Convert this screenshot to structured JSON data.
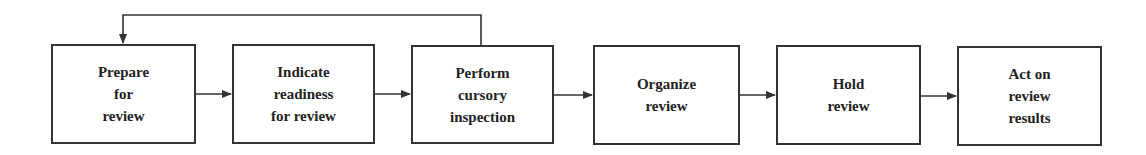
{
  "diagram": {
    "type": "flowchart",
    "steps": [
      {
        "id": "s1",
        "label": "Prepare\nfor\nreview",
        "x": 51,
        "y": 44,
        "w": 145,
        "h": 100
      },
      {
        "id": "s2",
        "label": "Indicate\nreadiness\nfor review",
        "x": 232,
        "y": 44,
        "w": 143,
        "h": 100
      },
      {
        "id": "s3",
        "label": "Perform\ncursory\ninspection",
        "x": 411,
        "y": 45,
        "w": 143,
        "h": 99
      },
      {
        "id": "s4",
        "label": "Organize\nreview",
        "x": 593,
        "y": 45,
        "w": 147,
        "h": 100
      },
      {
        "id": "s5",
        "label": "Hold\nreview",
        "x": 776,
        "y": 45,
        "w": 145,
        "h": 100
      },
      {
        "id": "s6",
        "label": "Act on\nreview\nresults",
        "x": 957,
        "y": 46,
        "w": 145,
        "h": 100
      }
    ],
    "edges": [
      {
        "from": "s1",
        "to": "s2"
      },
      {
        "from": "s2",
        "to": "s3"
      },
      {
        "from": "s3",
        "to": "s4"
      },
      {
        "from": "s4",
        "to": "s5"
      },
      {
        "from": "s5",
        "to": "s6"
      },
      {
        "from": "s3",
        "to": "s1",
        "kind": "feedback-loop"
      }
    ],
    "colors": {
      "stroke": "#333333",
      "text": "#222222",
      "background": "#ffffff"
    }
  }
}
